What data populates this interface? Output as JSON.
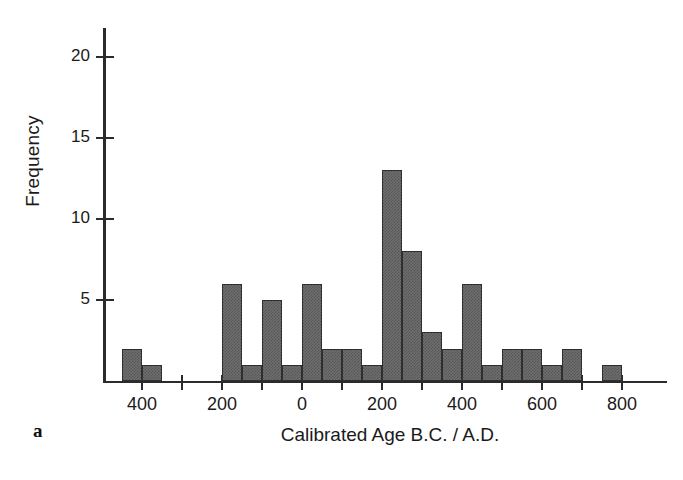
{
  "figure": {
    "panel_label": "a",
    "background": "#ffffff",
    "bar_color": "#6e6e6e",
    "bar_edge_color": "#2f2f2f",
    "axis_color": "#2b2b2b"
  },
  "chart_data": {
    "type": "bar",
    "title": "",
    "xlabel": "Calibrated Age B.C. / A.D.",
    "ylabel": "Frequency",
    "grid": false,
    "legend": null,
    "bin_width": 50,
    "xlim": [
      -500,
      900
    ],
    "ylim": [
      0,
      22
    ],
    "y_ticks": [
      5,
      10,
      15,
      20
    ],
    "y_tick_labels": [
      "5",
      "10",
      "15",
      "20"
    ],
    "x_ticks": [
      -400,
      -300,
      -200,
      -100,
      0,
      100,
      200,
      300,
      400,
      500,
      600,
      700,
      800
    ],
    "x_major_ticks": [
      -400,
      -200,
      0,
      200,
      400,
      600,
      800
    ],
    "x_tick_labels": [
      "400",
      "200",
      "0",
      "200",
      "400",
      "600",
      "800"
    ],
    "x_minor_ticks": [
      -300,
      -100,
      100,
      300,
      500,
      700
    ],
    "bins": [
      {
        "start": -450,
        "end": -400,
        "value": 2
      },
      {
        "start": -400,
        "end": -350,
        "value": 1
      },
      {
        "start": -350,
        "end": -300,
        "value": 0
      },
      {
        "start": -300,
        "end": -250,
        "value": 0
      },
      {
        "start": -250,
        "end": -200,
        "value": 0
      },
      {
        "start": -200,
        "end": -150,
        "value": 6
      },
      {
        "start": -150,
        "end": -100,
        "value": 1
      },
      {
        "start": -100,
        "end": -50,
        "value": 5
      },
      {
        "start": -50,
        "end": 0,
        "value": 1
      },
      {
        "start": 0,
        "end": 50,
        "value": 6
      },
      {
        "start": 50,
        "end": 100,
        "value": 2
      },
      {
        "start": 100,
        "end": 150,
        "value": 2
      },
      {
        "start": 150,
        "end": 200,
        "value": 1
      },
      {
        "start": 200,
        "end": 250,
        "value": 13
      },
      {
        "start": 250,
        "end": 300,
        "value": 8
      },
      {
        "start": 300,
        "end": 350,
        "value": 3
      },
      {
        "start": 350,
        "end": 400,
        "value": 2
      },
      {
        "start": 400,
        "end": 450,
        "value": 6
      },
      {
        "start": 450,
        "end": 500,
        "value": 1
      },
      {
        "start": 500,
        "end": 550,
        "value": 2
      },
      {
        "start": 550,
        "end": 600,
        "value": 2
      },
      {
        "start": 600,
        "end": 650,
        "value": 1
      },
      {
        "start": 650,
        "end": 700,
        "value": 2
      },
      {
        "start": 700,
        "end": 750,
        "value": 0
      },
      {
        "start": 750,
        "end": 800,
        "value": 1
      }
    ]
  }
}
